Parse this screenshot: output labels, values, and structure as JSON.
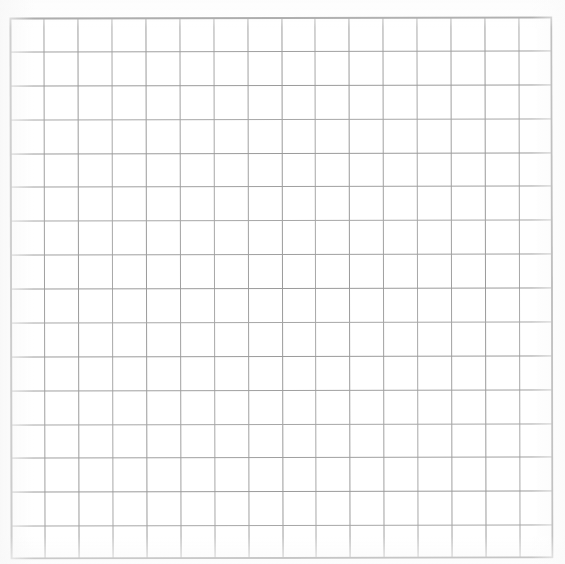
{
  "document": {
    "kind": "grid-paper-scan",
    "title": "Blank graph paper grid",
    "background_color": "#ffffff",
    "canvas": {
      "width": 565,
      "height": 564
    }
  },
  "grid": {
    "label": "graph-paper-grid",
    "origin_x": 10,
    "origin_y": 17,
    "width": 543,
    "height": 542,
    "columns": 16,
    "rows": 16,
    "cell_width": 33.9,
    "cell_height": 33.9,
    "line_color": "#9a9a9a",
    "line_width": 1,
    "border_color": "#8a8a8a",
    "border_width": 2,
    "has_labels": false,
    "has_content": false,
    "annotations": []
  },
  "margins": {
    "left": 10,
    "top": 17,
    "right": 12,
    "bottom": 5
  },
  "artifacts": {
    "skew_degrees": -0.12,
    "description": "faint scanner edge shading along left, right and bottom"
  }
}
